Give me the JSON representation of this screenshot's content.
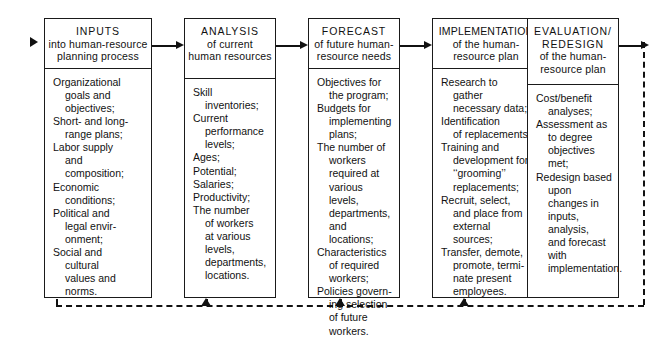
{
  "diagram": {
    "title": "Human-Resource Planning Process",
    "stages": [
      {
        "id": "inputs",
        "stage_label": "INPUTS",
        "subtitle_lines": [
          "into human-resource",
          "planning process"
        ],
        "entries": [
          [
            "Organizational",
            "goals and",
            "objectives;"
          ],
          [
            "Short- and long-",
            "range plans;"
          ],
          [
            "Labor supply",
            "and",
            "composition;"
          ],
          [
            "Economic",
            "conditions;"
          ],
          [
            "Political and",
            "legal envir-",
            "onment;"
          ],
          [
            "Social and",
            "cultural",
            "values and",
            "norms."
          ]
        ]
      },
      {
        "id": "analysis",
        "stage_label": "ANALYSIS",
        "subtitle_lines": [
          "of current",
          "human resources"
        ],
        "entries": [
          [
            "Skill",
            "inventories;"
          ],
          [
            "Current",
            "performance",
            "levels;"
          ],
          [
            "Ages;"
          ],
          [
            "Potential;"
          ],
          [
            "Salaries;"
          ],
          [
            "Productivity;"
          ],
          [
            "The number",
            "of workers",
            "at various",
            "levels,",
            "departments,",
            "locations."
          ]
        ]
      },
      {
        "id": "forecast",
        "stage_label": "FORECAST",
        "subtitle_lines": [
          "of future human-",
          "resource needs"
        ],
        "entries": [
          [
            "Objectives for",
            "the program;"
          ],
          [
            "Budgets for",
            "implementing",
            "plans;"
          ],
          [
            "The number of",
            "workers",
            "required at",
            "various levels,",
            "departments,",
            "and locations;"
          ],
          [
            "Characteristics",
            "of required",
            "workers;"
          ],
          [
            "Policies govern-",
            "ing selection",
            "of future",
            "workers."
          ]
        ]
      },
      {
        "id": "implementation",
        "stage_label": "IMPLEMENTATION",
        "subtitle_lines": [
          "of the human-",
          "resource plan"
        ],
        "entries": [
          [
            "Research to",
            "gather",
            "necessary data;"
          ],
          [
            "Identification",
            "of replacements;"
          ],
          [
            "Training and",
            "development for",
            "‘‘grooming’’",
            "replacements;"
          ],
          [
            "Recruit, select,",
            "and place from",
            "external",
            "sources;"
          ],
          [
            "Transfer, demote,",
            "promote, termi-",
            "nate present",
            "employees."
          ]
        ]
      },
      {
        "id": "evaluation",
        "stage_label": "EVALUATION/",
        "stage_label_2": "REDESIGN",
        "subtitle_lines": [
          "of the human-",
          "resource plan"
        ],
        "entries": [
          [
            "Cost/benefit",
            "analyses;"
          ],
          [
            "Assessment as",
            "to degree",
            "objectives met;"
          ],
          [
            "Redesign based",
            "upon changes in",
            "inputs, analysis,",
            "and forecast",
            "with",
            "implementation."
          ]
        ]
      }
    ],
    "connectors": [
      {
        "name": "inputs-to-analysis"
      },
      {
        "name": "analysis-to-forecast"
      },
      {
        "name": "forecast-to-implementation"
      },
      {
        "name": "implementation-to-evaluation"
      },
      {
        "name": "evaluation-to-feedback"
      }
    ],
    "feedback_loop": {
      "name": "feedback-loop",
      "style": "dashed",
      "targets": [
        "inputs",
        "forecast",
        "implementation",
        "evaluation"
      ]
    },
    "colors": {
      "line": "#1a1a1a",
      "background": "#ffffff",
      "text": "#111111"
    }
  }
}
